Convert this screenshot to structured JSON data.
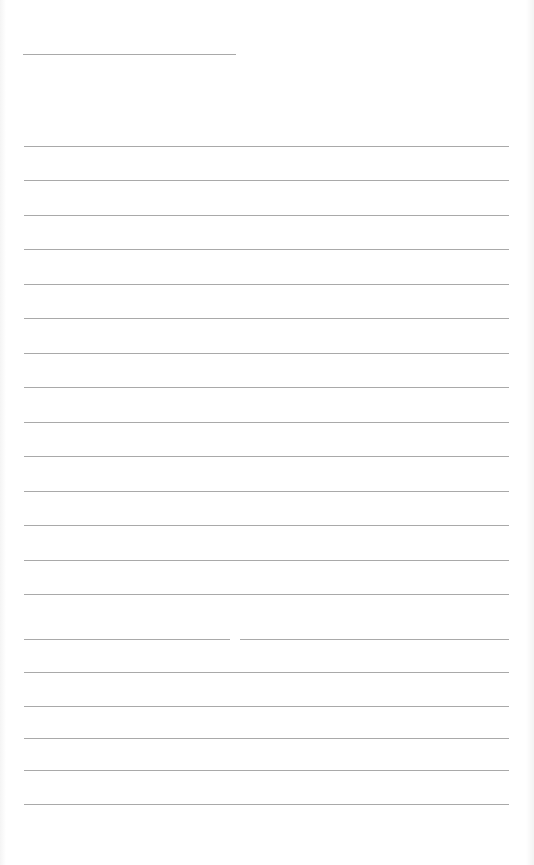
{
  "document": {
    "type": "lined-paper",
    "title_line": {
      "x": 23,
      "y": 54,
      "width": 213
    },
    "rule_color": "#9a9a9a",
    "background_color": "#ffffff",
    "lines": [
      {
        "y": 146
      },
      {
        "y": 180
      },
      {
        "y": 215
      },
      {
        "y": 249
      },
      {
        "y": 284
      },
      {
        "y": 318
      },
      {
        "y": 353
      },
      {
        "y": 387
      },
      {
        "y": 422
      },
      {
        "y": 456
      },
      {
        "y": 491
      },
      {
        "y": 525
      },
      {
        "y": 560
      },
      {
        "y": 594
      },
      {
        "y": 639,
        "gap": [
          230,
          240
        ]
      },
      {
        "y": 672
      },
      {
        "y": 706
      },
      {
        "y": 738
      },
      {
        "y": 770
      },
      {
        "y": 804
      }
    ],
    "line_left": 24,
    "line_right": 509
  }
}
